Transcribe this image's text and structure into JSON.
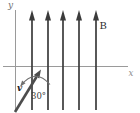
{
  "figure": {
    "type": "physics-field-diagram",
    "axes": {
      "x_label": "x",
      "y_label": "y"
    },
    "field": {
      "label": "B",
      "direction": "up",
      "line_count": 5,
      "x_positions": [
        32,
        48,
        63,
        79,
        96
      ]
    },
    "vector": {
      "label": "v"
    },
    "angle": {
      "label": "30°"
    },
    "colors": {
      "background": "#ffffff",
      "axis": "#9a9a9a",
      "field_line": "#3b3b3b",
      "vector": "#4d4d4d",
      "arc": "#6f6f6f",
      "text": "#2f2f2f"
    }
  }
}
